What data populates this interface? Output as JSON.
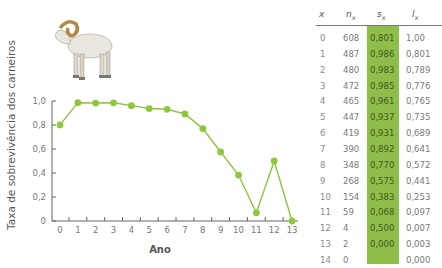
{
  "colors": {
    "line": "#8dc63f",
    "marker": "#8dc63f",
    "sx_column_bg": "#8fbd4a",
    "axis": "#666666"
  },
  "illustration": {
    "icon": "bighorn-sheep-icon"
  },
  "chart_data": {
    "type": "line",
    "title": "",
    "xlabel": "Ano",
    "ylabel": "Taxa de sobrevivência dos carneiros",
    "x": [
      0,
      1,
      2,
      3,
      4,
      5,
      6,
      7,
      8,
      9,
      10,
      11,
      12,
      13
    ],
    "series": [
      {
        "name": "sx",
        "values": [
          0.801,
          0.986,
          0.983,
          0.985,
          0.961,
          0.937,
          0.931,
          0.892,
          0.77,
          0.575,
          0.383,
          0.068,
          0.5,
          0.0
        ]
      }
    ],
    "xticks": [
      "0",
      "1",
      "2",
      "3",
      "4",
      "5",
      "6",
      "7",
      "8",
      "9",
      "10",
      "11",
      "12",
      "13"
    ],
    "yticks": [
      "0",
      "0,2",
      "0,4",
      "0,6",
      "0,8",
      "1,0"
    ],
    "ylim": [
      0,
      1.0
    ],
    "xlim": [
      0,
      13
    ],
    "grid": false,
    "legend": "none"
  },
  "table": {
    "headers": {
      "x": "x",
      "n": "n",
      "n_sub": "x",
      "s": "s",
      "s_sub": "x",
      "l": "l",
      "l_sub": "x"
    },
    "rows": [
      {
        "x": "0",
        "n": "608",
        "s": "0,801",
        "l": "1,00"
      },
      {
        "x": "1",
        "n": "487",
        "s": "0,986",
        "l": "0,801"
      },
      {
        "x": "2",
        "n": "480",
        "s": "0,983",
        "l": "0,789"
      },
      {
        "x": "3",
        "n": "472",
        "s": "0,985",
        "l": "0,776"
      },
      {
        "x": "4",
        "n": "465",
        "s": "0,961",
        "l": "0,765"
      },
      {
        "x": "5",
        "n": "447",
        "s": "0,937",
        "l": "0,735"
      },
      {
        "x": "6",
        "n": "419",
        "s": "0,931",
        "l": "0,689"
      },
      {
        "x": "7",
        "n": "390",
        "s": "0,892",
        "l": "0,641"
      },
      {
        "x": "8",
        "n": "348",
        "s": "0,770",
        "l": "0,572"
      },
      {
        "x": "9",
        "n": "268",
        "s": "0,575",
        "l": "0,441"
      },
      {
        "x": "10",
        "n": "154",
        "s": "0,383",
        "l": "0,253"
      },
      {
        "x": "11",
        "n": "59",
        "s": "0,068",
        "l": "0,097"
      },
      {
        "x": "12",
        "n": "4",
        "s": "0,500",
        "l": "0,007"
      },
      {
        "x": "13",
        "n": "2",
        "s": "0,000",
        "l": "0,003"
      },
      {
        "x": "14",
        "n": "0",
        "s": "",
        "l": "0,000"
      }
    ]
  }
}
